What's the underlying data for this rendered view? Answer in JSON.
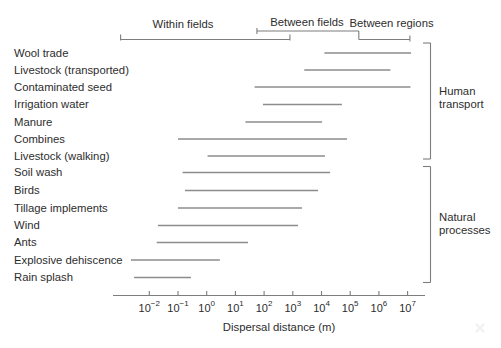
{
  "figure": {
    "background": "#ffffff",
    "text_color": "#2d2d2d",
    "bar_color": "#8c8c8c",
    "axis_color": "#7d7d7d"
  },
  "chart_data": {
    "type": "bar",
    "subtype": "horizontal-log-range-bars",
    "title": "",
    "xlabel": "Dispersal distance (m)",
    "x_scale": "log10",
    "x_axis_range_log10": [
      -3.3,
      7.6
    ],
    "x_ticks": [
      {
        "base": "10",
        "exp": "−2"
      },
      {
        "base": "10",
        "exp": "−1"
      },
      {
        "base": "10",
        "exp": "0"
      },
      {
        "base": "10",
        "exp": "1"
      },
      {
        "base": "10",
        "exp": "2"
      },
      {
        "base": "10",
        "exp": "3"
      },
      {
        "base": "10",
        "exp": "4"
      },
      {
        "base": "10",
        "exp": "5"
      },
      {
        "base": "10",
        "exp": "6"
      },
      {
        "base": "10",
        "exp": "7"
      }
    ],
    "x_tick_exponents": [
      -2,
      -1,
      0,
      1,
      2,
      3,
      4,
      5,
      6,
      7
    ],
    "rows": [
      {
        "label": "Wool trade",
        "group": "Human transport",
        "log10_min": 4.1,
        "log10_max": 7.12
      },
      {
        "label": "Livestock (transported)",
        "group": "Human transport",
        "log10_min": 3.4,
        "log10_max": 6.4
      },
      {
        "label": "Contaminated seed",
        "group": "Human transport",
        "log10_min": 1.67,
        "log10_max": 7.1
      },
      {
        "label": "Irrigation water",
        "group": "Human transport",
        "log10_min": 1.96,
        "log10_max": 4.71
      },
      {
        "label": "Manure",
        "group": "Human transport",
        "log10_min": 1.35,
        "log10_max": 4.02
      },
      {
        "label": "Combines",
        "group": "Human transport",
        "log10_min": -1.0,
        "log10_max": 4.89
      },
      {
        "label": "Livestock (walking)",
        "group": "Human transport",
        "log10_min": 0.03,
        "log10_max": 4.12
      },
      {
        "label": "Soil wash",
        "group": "Natural processes",
        "log10_min": -0.84,
        "log10_max": 4.3
      },
      {
        "label": "Birds",
        "group": "Natural processes",
        "log10_min": -0.76,
        "log10_max": 3.88
      },
      {
        "label": "Tillage implements",
        "group": "Natural processes",
        "log10_min": -1.0,
        "log10_max": 3.32
      },
      {
        "label": "Wind",
        "group": "Natural processes",
        "log10_min": -1.7,
        "log10_max": 3.18
      },
      {
        "label": "Ants",
        "group": "Natural processes",
        "log10_min": -1.74,
        "log10_max": 1.44
      },
      {
        "label": "Explosive dehiscence",
        "group": "Natural processes",
        "log10_min": -2.64,
        "log10_max": 0.46
      },
      {
        "label": "Rain splash",
        "group": "Natural processes",
        "log10_min": -2.53,
        "log10_max": -0.55
      }
    ],
    "scale_brackets": [
      {
        "label": "Within fields",
        "log10_min": -3.0,
        "log10_max": 2.9
      },
      {
        "label": "Between fields",
        "log10_min": 1.75,
        "log10_max": 5.3
      },
      {
        "label": "Between regions",
        "log10_min": 5.3,
        "log10_max": 7.08
      }
    ],
    "groups": [
      {
        "label": "Human transport",
        "first_row": 0,
        "last_row": 6
      },
      {
        "label": "Natural processes",
        "first_row": 7,
        "last_row": 13
      }
    ],
    "legend": null,
    "grid": false
  }
}
